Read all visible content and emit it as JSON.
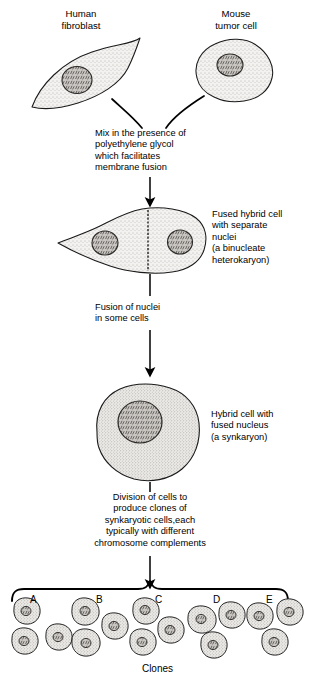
{
  "figure": {
    "title_top_left": "Human\nfibroblast",
    "title_top_right": "Mouse\ntumor cell",
    "step1_text": "Mix in the presence of\npolyethylene glycol\nwhich facilitates\nmembrane fusion",
    "label_fused": "Fused hybrid cell\nwith separate\nnuclei\n(a binucleate\nheterokaryon)",
    "step2_text": "Fusion of nuclei\nin some cells",
    "label_synkaryon": "Hybrid cell with\nfused nucleus\n(a synkaryon)",
    "step3_text": "Division of cells to\nproduce clones of\nsynkaryotic cells,each\ntypically with different\nchromosome complements",
    "clones_caption": "Clones",
    "clone_groups": [
      {
        "letter": "A"
      },
      {
        "letter": "B"
      },
      {
        "letter": "C"
      },
      {
        "letter": "D"
      },
      {
        "letter": "E"
      }
    ],
    "colors": {
      "ink": "#000000",
      "cytoplasm": "#f2f1ef",
      "nucleus": "#b9b6b2",
      "stipple": "#6f6c68",
      "background": "#ffffff"
    }
  }
}
